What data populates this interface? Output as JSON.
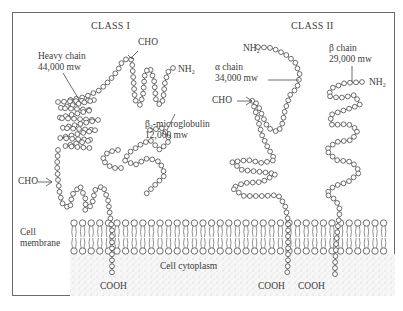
{
  "diagram": {
    "class1": {
      "title": "CLASS I",
      "heavy_chain": {
        "name": "Heavy chain",
        "mw": "44,000 mw"
      },
      "b2m": {
        "name_prefix": "β",
        "name_sub": "2",
        "name_suffix": "-microglobulin",
        "mw": "12,000 mw"
      },
      "cho_top": "CHO",
      "cho_left": "CHO",
      "nh2": "NH",
      "nh2_sub": "2",
      "cooh": "COOH"
    },
    "class2": {
      "title": "CLASS II",
      "alpha_chain": {
        "name": "α chain",
        "mw": "34,000 mw"
      },
      "beta_chain": {
        "name": "β chain",
        "mw": "29,000 mw"
      },
      "alpha_nh2": "NH",
      "beta_nh2": "NH",
      "nh2_sub": "2",
      "cho": "CHO",
      "cooh_alpha": "COOH",
      "cooh_beta": "COOH"
    },
    "membrane_label_1": "Cell",
    "membrane_label_2": "membrane",
    "cytoplasm_label": "Cell cytoplasm",
    "colors": {
      "line": "#4a4a4a",
      "bead_fill": "#ffffff",
      "stipple": "#d6d6d6",
      "frame": "#6a6a6a"
    }
  }
}
